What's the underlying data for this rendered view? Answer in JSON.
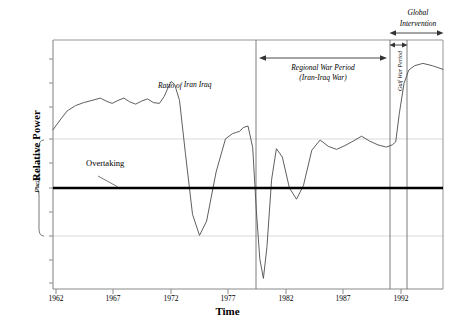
{
  "chart_data": {
    "type": "line",
    "title": "",
    "xlabel": "Time",
    "ylabel": "Relative Power",
    "xlim": [
      1962,
      1995
    ],
    "ylim": [
      -3.2,
      3.4
    ],
    "grid": true,
    "legend_position": "none",
    "series_name": "Ratio of Iran/Iraq",
    "xtick_labels": [
      "1962",
      "1967",
      "1972",
      "1977",
      "1982",
      "1987",
      "1992"
    ],
    "xtick_values": [
      1962,
      1967,
      1972,
      1977,
      1982,
      1987,
      1992
    ],
    "ytick_labels": [],
    "reference_lines": [
      {
        "name": "parity",
        "label": "Parity",
        "y_value": 0.0,
        "style": "thick-black"
      },
      {
        "name": "upper-gridline",
        "y_value": 1.0,
        "style": "light-grey"
      },
      {
        "name": "lower-gridline",
        "y_value": -1.0,
        "style": "light-grey"
      }
    ],
    "vertical_dividers": [
      {
        "name": "regional-war-start",
        "x_value": 1979.6
      },
      {
        "name": "gulf-war-start",
        "x_value": 1990.9
      },
      {
        "name": "gulf-war-end",
        "x_value": 1992.3
      }
    ],
    "annotations": [
      {
        "name": "overtaking",
        "text": "Overtaking",
        "style": "plain",
        "points_to": "parity-line"
      },
      {
        "name": "ratio-label",
        "text": "Ratio of",
        "numerator": "Iran",
        "denominator": "Iraq",
        "style": "italic-fraction"
      },
      {
        "name": "regional-war-period",
        "line1": "Regional War Period",
        "line2": "(Iran-Iraq War)",
        "style": "italic",
        "span": [
          1979.9,
          1990.8
        ],
        "arrow": "double"
      },
      {
        "name": "gulf-war-period",
        "text": "Gulf War Period",
        "style": "italic-rotated",
        "span": [
          1990.9,
          1992.3
        ],
        "arrow": "double"
      },
      {
        "name": "global-intervention",
        "line1": "Global",
        "line2": "Intervention",
        "style": "italic",
        "span": [
          1990.9,
          1995.0
        ],
        "arrow": "double"
      }
    ],
    "x": [
      1962.0,
      1962.6,
      1963.2,
      1963.9,
      1964.6,
      1965.3,
      1966.0,
      1966.5,
      1967.0,
      1967.5,
      1968.0,
      1968.5,
      1969.0,
      1969.5,
      1970.0,
      1970.5,
      1971.0,
      1971.4,
      1971.8,
      1972.0,
      1972.3,
      1972.7,
      1973.2,
      1973.8,
      1974.4,
      1975.0,
      1975.8,
      1976.6,
      1977.2,
      1977.5,
      1977.8,
      1978.1,
      1978.5,
      1978.9,
      1979.2,
      1979.5,
      1979.8,
      1980.1,
      1980.5,
      1980.9,
      1981.4,
      1982.0,
      1982.6,
      1983.2,
      1983.9,
      1984.6,
      1985.3,
      1986.0,
      1986.7,
      1987.4,
      1988.1,
      1988.8,
      1989.5,
      1990.2,
      1990.7,
      1991.0,
      1991.3,
      1991.7,
      1992.1,
      1992.6,
      1993.3,
      1994.1,
      1995.0
    ],
    "y": [
      1.02,
      1.28,
      1.52,
      1.66,
      1.74,
      1.8,
      1.86,
      1.78,
      1.72,
      1.8,
      1.86,
      1.76,
      1.7,
      1.78,
      1.84,
      1.74,
      1.72,
      1.9,
      2.18,
      2.3,
      2.22,
      1.8,
      0.4,
      -1.22,
      -1.78,
      -1.4,
      -0.1,
      0.78,
      0.92,
      0.95,
      0.98,
      1.08,
      1.12,
      0.55,
      -1.1,
      -2.4,
      -2.92,
      -2.1,
      -0.3,
      0.52,
      0.3,
      -0.52,
      -0.82,
      -0.45,
      0.48,
      0.75,
      0.58,
      0.5,
      0.6,
      0.72,
      0.85,
      0.72,
      0.62,
      0.56,
      0.62,
      0.7,
      1.45,
      2.25,
      2.6,
      2.72,
      2.78,
      2.72,
      2.62
    ]
  },
  "axis": {
    "y_title": "Relative Power",
    "x_title": "Time",
    "parity_brace_label": "Parity"
  },
  "labels": {
    "overtaking": "Overtaking",
    "ratio_of": "Ratio of",
    "ratio_numerator": "Iran",
    "ratio_denominator": "Iraq",
    "regional_war_line1": "Regional War Period",
    "regional_war_line2": "(Iran-Iraq War)",
    "gulf_war_period": "Gulf War Period",
    "global_line1": "Global",
    "global_line2": "Intervention"
  },
  "ticks": {
    "x": [
      "1962",
      "1967",
      "1972",
      "1977",
      "1982",
      "1987",
      "1992"
    ]
  },
  "colors": {
    "line": "#4d4d4d",
    "parity": "#000000",
    "grid": "#d9d9d9",
    "frame": "#808080",
    "text": "#000000"
  }
}
